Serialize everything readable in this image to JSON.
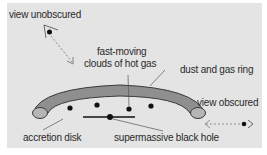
{
  "diagram": {
    "colors": {
      "background": "#e4e4e4",
      "ring_fill": "#8f8f8f",
      "ring_stroke": "#3a3a3a",
      "text": "#2a2a2a",
      "dot": "#111111"
    },
    "labels": {
      "view_unobscured": "view unobscured",
      "fast_moving_line1": "fast-moving",
      "fast_moving_line2": "clouds of hot gas",
      "dust_gas_ring": "dust and gas ring",
      "view_obscured": "view obscured",
      "accretion_disk": "accretion disk",
      "black_hole": "supermassive black hole"
    },
    "icons": {
      "observer_top": "eye-observer-icon",
      "observer_side": "eye-observer-icon",
      "arrow_top": "dashed-arrow-icon",
      "arrow_side": "dashed-double-arrow-icon"
    }
  }
}
